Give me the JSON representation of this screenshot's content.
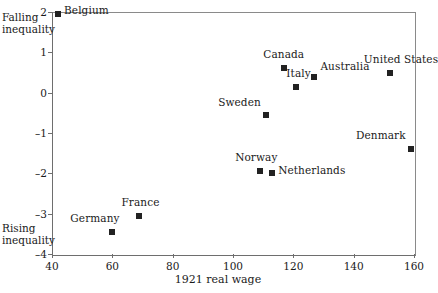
{
  "chart_data": {
    "type": "scatter",
    "title": "",
    "xlabel": "1921 real wage",
    "ylabel": "",
    "xlim": [
      40,
      160
    ],
    "ylim": [
      -4,
      2
    ],
    "xticks": [
      40,
      60,
      80,
      100,
      120,
      140,
      160
    ],
    "yticks": [
      2,
      1,
      0,
      -1,
      -2,
      -3,
      -4
    ],
    "grid": false,
    "legend": null,
    "annotations": [
      {
        "id": "falling",
        "line1": "Falling",
        "line2": "inequality"
      },
      {
        "id": "rising",
        "line1": "Rising",
        "line2": "inequality"
      }
    ],
    "points": [
      {
        "label": "Belgium",
        "x": 42,
        "y": 1.95,
        "label_dx": 6,
        "label_dy": -3
      },
      {
        "label": "Germany",
        "x": 60,
        "y": -3.45,
        "label_dx": -42,
        "label_dy": -13
      },
      {
        "label": "France",
        "x": 69,
        "y": -3.05,
        "label_dx": -18,
        "label_dy": -13
      },
      {
        "label": "Norway",
        "x": 109,
        "y": -1.95,
        "label_dx": -25,
        "label_dy": -13
      },
      {
        "label": "Netherlands",
        "x": 113,
        "y": -2.0,
        "label_dx": 6,
        "label_dy": -2
      },
      {
        "label": "Sweden",
        "x": 111,
        "y": -0.55,
        "label_dx": -48,
        "label_dy": -12
      },
      {
        "label": "Canada",
        "x": 117,
        "y": 0.6,
        "label_dx": -21,
        "label_dy": -13
      },
      {
        "label": "Italy",
        "x": 121,
        "y": 0.15,
        "label_dx": -10,
        "label_dy": -13
      },
      {
        "label": "Australia",
        "x": 127,
        "y": 0.4,
        "label_dx": 6,
        "label_dy": -10
      },
      {
        "label": "United States",
        "x": 152,
        "y": 0.5,
        "label_dx": -26,
        "label_dy": -13
      },
      {
        "label": "Denmark",
        "x": 159,
        "y": -1.4,
        "label_dx": -55,
        "label_dy": -13
      }
    ]
  }
}
